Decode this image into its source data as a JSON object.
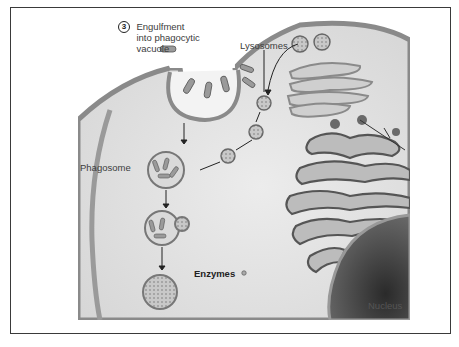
{
  "figure": {
    "type": "cell-biology illustration",
    "step": {
      "number": "3",
      "title_line1": "Engulfment",
      "title_line2": "into phagocytic",
      "title_line3": "vacuole"
    },
    "labels": {
      "lysosomes": "Lysosomes",
      "phagosome": "Phagosome",
      "enzymes": "Enzymes",
      "nucleus": "Nucleus"
    },
    "colors": {
      "frame": "#3a3a3a",
      "cytoplasm": "#e4e4e4",
      "membrane": "#8a8a8a",
      "nucleus": "#3a3a3a",
      "organelle_fill": "#bdbdbd",
      "organelle_stroke": "#555555"
    }
  }
}
